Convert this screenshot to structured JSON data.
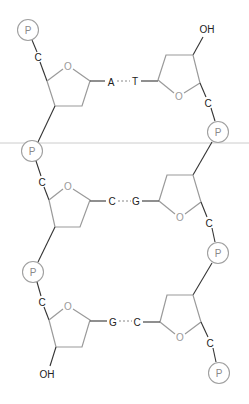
{
  "diagram": {
    "type": "dna-double-strand-segment",
    "phosphate_label": "P",
    "carbon_label": "C",
    "ring_oxygen_label": "O",
    "hydroxyl_label": "OH",
    "base_pairs": [
      {
        "left": "A",
        "right": "T"
      },
      {
        "left": "C",
        "right": "G"
      },
      {
        "left": "G",
        "right": "C"
      }
    ],
    "colors": {
      "ring": "#9a9a9a",
      "bond": "#333333",
      "phosphate_outline": "#a0a0a0",
      "divider": "#cccccc"
    }
  }
}
